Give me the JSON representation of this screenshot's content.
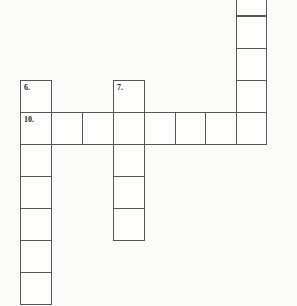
{
  "puzzle": {
    "type": "crossword-fragment",
    "cell_size_px": 31,
    "labels": [
      {
        "number": "6.",
        "col": 0,
        "row": 2
      },
      {
        "number": "7.",
        "col": 3,
        "row": 2
      },
      {
        "number": "10.",
        "col": 0,
        "row": 3
      }
    ],
    "entries": [
      {
        "id": "6-down",
        "start": {
          "col": 0,
          "row": 2
        },
        "direction": "down",
        "length": 7
      },
      {
        "id": "7-down",
        "start": {
          "col": 3,
          "row": 2
        },
        "direction": "down",
        "length": 5
      },
      {
        "id": "10-across",
        "start": {
          "col": 0,
          "row": 3
        },
        "direction": "across",
        "length": 8
      },
      {
        "id": "right-down",
        "start": {
          "col": 7,
          "row": -1
        },
        "direction": "down",
        "length": 5
      }
    ]
  },
  "colors": {
    "grid_line": "#555555",
    "cell_fill": "#fdfdfc",
    "background": "#fbfbfa",
    "bleed_text": "#e9e9e7"
  }
}
